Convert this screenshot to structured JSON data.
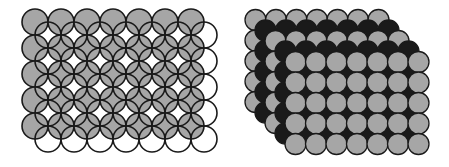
{
  "figure": {
    "panels": [
      {
        "name": "square-layer-overlap-top-view",
        "layers": [
          {
            "color": "#a6a6a6",
            "x0": 35,
            "y0": 22,
            "cols": 7,
            "rows": 5,
            "r": 13,
            "step": 26
          },
          {
            "color": "none",
            "x0": 48,
            "y0": 35,
            "cols": 7,
            "rows": 5,
            "r": 13,
            "step": 26
          }
        ]
      },
      {
        "name": "stacked-layers-perspective",
        "layers": [
          {
            "color": "#a6a6a6",
            "x0": 255.5,
            "y0": 20,
            "cols": 7,
            "rows": 5,
            "r": 10.5,
            "step": 20.5
          },
          {
            "color": "#1a1a1a",
            "x0": 265.5,
            "y0": 30.5,
            "cols": 7,
            "rows": 5,
            "r": 10.5,
            "step": 20.5
          },
          {
            "color": "#a6a6a6",
            "x0": 275.5,
            "y0": 41,
            "cols": 7,
            "rows": 5,
            "r": 10.5,
            "step": 20.5
          },
          {
            "color": "#1a1a1a",
            "x0": 285.5,
            "y0": 51.5,
            "cols": 7,
            "rows": 5,
            "r": 10.5,
            "step": 20.5
          },
          {
            "color": "#a6a6a6",
            "x0": 295.5,
            "y0": 62,
            "cols": 7,
            "rows": 5,
            "r": 10.5,
            "step": 20.5
          }
        ]
      }
    ],
    "stroke": "#1a1a1a"
  }
}
